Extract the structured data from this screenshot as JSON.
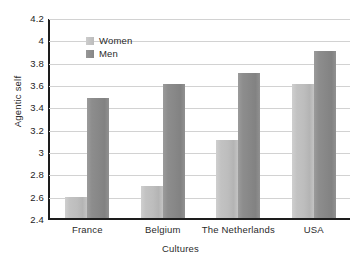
{
  "caption": "",
  "chart_data": {
    "type": "bar",
    "title": "",
    "xlabel": "Cultures",
    "ylabel": "Agentic self",
    "categories": [
      "France",
      "Belgium",
      "The Netherlands",
      "USA"
    ],
    "series": [
      {
        "name": "Women",
        "color": "#c0c0c0",
        "values": [
          2.59,
          2.69,
          3.1,
          3.6
        ]
      },
      {
        "name": "Men",
        "color": "#8a8a8a",
        "values": [
          3.48,
          3.6,
          3.7,
          3.9
        ]
      }
    ],
    "ylim": [
      2.4,
      4.2
    ],
    "yticks": [
      "2.4",
      "2.6",
      "2.8",
      "3",
      "3.2",
      "3.4",
      "3.6",
      "3.8",
      "4",
      "4.2"
    ],
    "ytick_values": [
      2.4,
      2.6,
      2.8,
      3.0,
      3.2,
      3.4,
      3.6,
      3.8,
      4.0,
      4.2
    ],
    "grid": true,
    "legend_position": "upper-left-inside"
  },
  "legend": {
    "items": [
      {
        "label": "Women"
      },
      {
        "label": "Men"
      }
    ]
  }
}
